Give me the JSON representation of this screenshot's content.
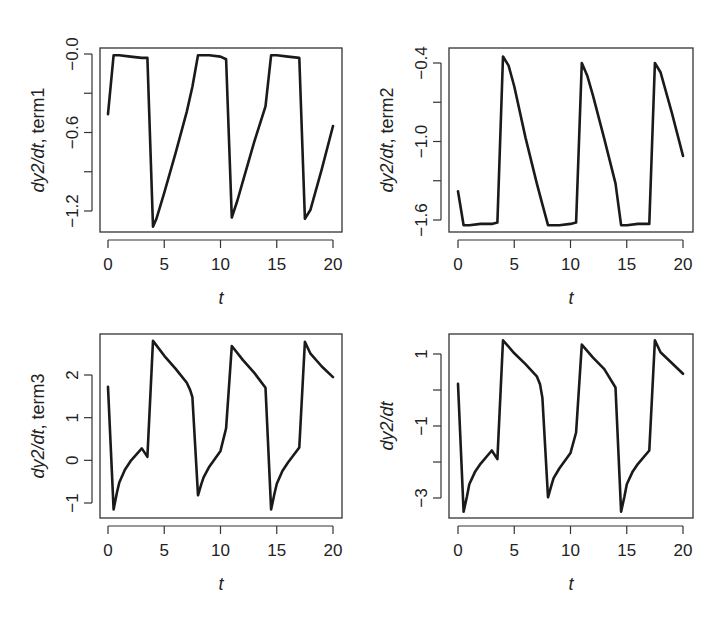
{
  "chart_data": [
    {
      "type": "line",
      "panel": "top-left",
      "xlabel": "t",
      "ylabel_italic": "dy2/dt",
      "ylabel_rest": ", term1",
      "xlim": [
        0,
        20
      ],
      "ylim": [
        -1.33,
        0.02
      ],
      "xticks": [
        0,
        5,
        10,
        15,
        20
      ],
      "xtick_labels": [
        "0",
        "5",
        "10",
        "15",
        "20"
      ],
      "yticks": [
        0.0,
        -0.3,
        -0.6,
        -0.9,
        -1.2
      ],
      "ytick_labels": [
        "-0.0",
        "",
        "-0.6",
        "",
        "-1.2"
      ],
      "x": [
        0,
        0.5,
        1,
        2,
        3,
        3.5,
        4,
        4.3,
        5,
        6,
        7,
        7.5,
        8,
        9,
        10,
        10.5,
        11,
        11.5,
        12,
        13,
        14,
        14.5,
        15,
        16,
        17,
        17.5,
        18,
        19,
        20
      ],
      "y": [
        -0.46,
        -0.01,
        -0.01,
        -0.02,
        -0.03,
        -0.03,
        -1.32,
        -1.26,
        -1.06,
        -0.76,
        -0.44,
        -0.25,
        -0.01,
        -0.01,
        -0.02,
        -0.04,
        -1.25,
        -1.12,
        -0.97,
        -0.67,
        -0.4,
        -0.01,
        -0.01,
        -0.02,
        -0.03,
        -1.26,
        -1.19,
        -0.88,
        -0.55
      ]
    },
    {
      "type": "line",
      "panel": "top-right",
      "xlabel": "t",
      "ylabel_italic": "dy2/dt",
      "ylabel_rest": ", term2",
      "xlim": [
        0,
        20
      ],
      "ylim": [
        -1.68,
        -0.33
      ],
      "xticks": [
        0,
        5,
        10,
        15,
        20
      ],
      "xtick_labels": [
        "0",
        "5",
        "10",
        "15",
        "20"
      ],
      "yticks": [
        -0.4,
        -0.7,
        -1.0,
        -1.3,
        -1.6
      ],
      "ytick_labels": [
        "-0.4",
        "",
        "-1.0",
        "",
        "-1.6"
      ],
      "x": [
        0,
        0.5,
        1,
        2,
        3,
        3.5,
        4,
        4.5,
        5,
        6,
        7,
        7.5,
        8,
        9,
        10,
        10.5,
        11,
        11.5,
        12,
        13,
        14,
        14.5,
        15,
        16,
        17,
        17.5,
        18,
        19,
        20
      ],
      "y": [
        -1.38,
        -1.64,
        -1.64,
        -1.63,
        -1.63,
        -1.62,
        -0.35,
        -0.42,
        -0.58,
        -0.97,
        -1.32,
        -1.48,
        -1.64,
        -1.64,
        -1.63,
        -1.62,
        -0.4,
        -0.5,
        -0.65,
        -0.98,
        -1.32,
        -1.64,
        -1.64,
        -1.63,
        -1.63,
        -0.4,
        -0.47,
        -0.78,
        -1.11
      ]
    },
    {
      "type": "line",
      "panel": "bottom-left",
      "xlabel": "t",
      "ylabel_italic": "dy2/dt",
      "ylabel_rest": ", term3",
      "xlim": [
        0,
        20
      ],
      "ylim": [
        -1.3,
        2.95
      ],
      "xticks": [
        0,
        5,
        10,
        15,
        20
      ],
      "xtick_labels": [
        "0",
        "5",
        "10",
        "15",
        "20"
      ],
      "yticks": [
        -1,
        0,
        1,
        2
      ],
      "ytick_labels": [
        "-1",
        "0",
        "1",
        "2"
      ],
      "x": [
        0,
        0.5,
        0.8,
        1,
        1.5,
        2,
        3,
        3.5,
        4,
        5,
        6,
        7,
        7.3,
        7.5,
        8,
        8.3,
        8.5,
        9,
        10,
        10.5,
        11,
        12,
        13,
        14,
        14.5,
        14.8,
        15,
        15.5,
        16,
        17,
        17.5,
        18,
        19,
        20
      ],
      "y": [
        1.72,
        -1.15,
        -0.75,
        -0.52,
        -0.22,
        -0.02,
        0.28,
        0.08,
        2.8,
        2.45,
        2.15,
        1.82,
        1.65,
        1.48,
        -0.82,
        -0.55,
        -0.4,
        -0.15,
        0.22,
        0.75,
        2.68,
        2.35,
        2.05,
        1.7,
        -1.15,
        -0.78,
        -0.55,
        -0.25,
        -0.05,
        0.3,
        2.78,
        2.5,
        2.2,
        1.95
      ]
    },
    {
      "type": "line",
      "panel": "bottom-right",
      "xlabel": "t",
      "ylabel_italic": "dy2/dt",
      "ylabel_rest": "",
      "xlim": [
        0,
        20
      ],
      "ylim": [
        -3.6,
        1.6
      ],
      "xticks": [
        0,
        5,
        10,
        15,
        20
      ],
      "xtick_labels": [
        "0",
        "5",
        "10",
        "15",
        "20"
      ],
      "yticks": [
        -3,
        -2,
        -1,
        0,
        1
      ],
      "ytick_labels": [
        "-3",
        "",
        "-1",
        "",
        "1"
      ],
      "x": [
        0,
        0.5,
        0.8,
        1,
        1.5,
        2,
        3,
        3.5,
        4,
        5,
        6,
        7,
        7.3,
        7.5,
        8,
        8.3,
        8.5,
        9,
        10,
        10.5,
        11,
        12,
        13,
        14,
        14.5,
        14.8,
        15,
        15.5,
        16,
        17,
        17.5,
        18,
        19,
        20
      ],
      "y": [
        0.17,
        -3.38,
        -2.95,
        -2.62,
        -2.28,
        -2.05,
        -1.68,
        -1.92,
        1.38,
        1.02,
        0.72,
        0.38,
        0.15,
        -0.22,
        -2.98,
        -2.65,
        -2.45,
        -2.18,
        -1.75,
        -1.18,
        1.26,
        0.9,
        0.58,
        0.07,
        -3.38,
        -2.95,
        -2.62,
        -2.28,
        -2.05,
        -1.68,
        1.38,
        1.05,
        0.75,
        0.45
      ]
    }
  ],
  "style": {
    "line_color": "#1a1a1a",
    "axis_color": "#333333",
    "background": "#ffffff"
  }
}
